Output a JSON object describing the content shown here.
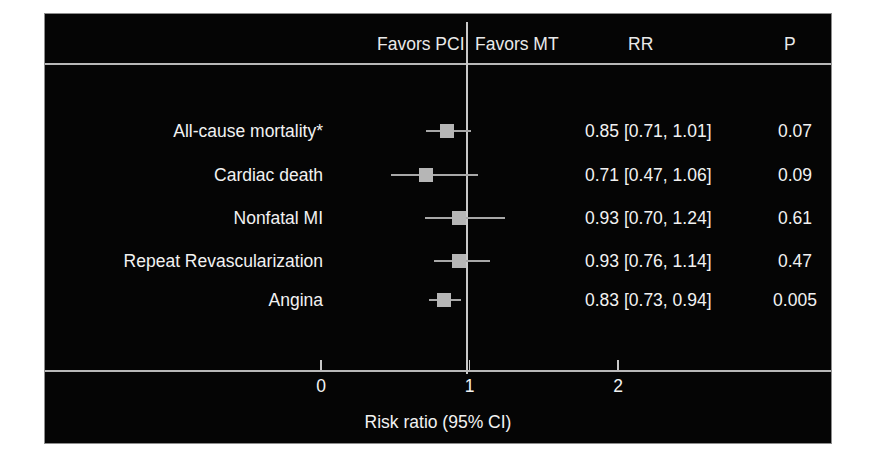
{
  "header": {
    "favors_left": "Favors PCI",
    "favors_right": "Favors MT",
    "rr_column": "RR",
    "p_column": "P"
  },
  "axis": {
    "title": "Risk ratio (95% CI)",
    "ticks": [
      "0",
      "1",
      "2"
    ]
  },
  "rows": [
    {
      "label": "All-cause mortality*",
      "rr_text": "0.85 [0.71, 1.01]",
      "p_text": "0.07"
    },
    {
      "label": "Cardiac death",
      "rr_text": "0.71 [0.47, 1.06]",
      "p_text": "0.09"
    },
    {
      "label": "Nonfatal MI",
      "rr_text": "0.93 [0.70, 1.24]",
      "p_text": "0.61"
    },
    {
      "label": "Repeat Revascularization",
      "rr_text": "0.93 [0.76, 1.14]",
      "p_text": "0.47"
    },
    {
      "label": "Angina",
      "rr_text": "0.83 [0.73, 0.94]",
      "p_text": "0.005"
    }
  ],
  "colors": {
    "background": "#050505",
    "text": "#f2f2f2",
    "rule": "#b9b9b9",
    "marker": "#b6b6b6"
  },
  "chart_data": {
    "type": "forest",
    "title": "",
    "xlabel": "Risk ratio (95% CI)",
    "ylabel": "",
    "xlim": [
      0,
      2.55
    ],
    "xticks": [
      0,
      1,
      2
    ],
    "reference_line": 1,
    "grid": false,
    "legend": "none",
    "annotations": [
      "Favors PCI",
      "Favors MT"
    ],
    "categories": [
      "All-cause mortality*",
      "Cardiac death",
      "Nonfatal MI",
      "Repeat Revascularization",
      "Angina"
    ],
    "estimates": [
      0.85,
      0.71,
      0.93,
      0.93,
      0.83
    ],
    "ci_lower": [
      0.71,
      0.47,
      0.7,
      0.76,
      0.73
    ],
    "ci_upper": [
      1.01,
      1.06,
      1.24,
      1.14,
      0.94
    ],
    "p_values": [
      0.07,
      0.09,
      0.61,
      0.47,
      0.005
    ]
  }
}
